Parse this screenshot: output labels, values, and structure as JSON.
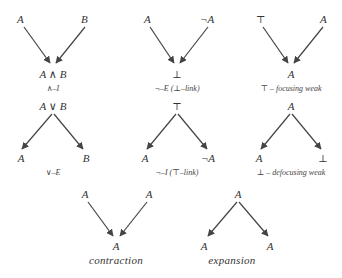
{
  "diagrams": [
    {
      "id": "and-intro",
      "top_left": "A",
      "top_right": "B",
      "bottom": "A ∧ B",
      "label": "∧–I",
      "direction": "converge"
    },
    {
      "id": "not-elim",
      "top_left": "A",
      "top_right": "¬A",
      "bottom": "⊥",
      "label": "¬–E  (⊥–link)",
      "direction": "converge"
    },
    {
      "id": "top-focusing-weak",
      "top_left": "⊤",
      "top_right": "A",
      "bottom": "A",
      "label": "⊤ – focusing weak",
      "direction": "converge"
    },
    {
      "id": "or-elim",
      "top": "A ∨ B",
      "bottom_left": "A",
      "bottom_right": "B",
      "label": "∨–E",
      "direction": "diverge"
    },
    {
      "id": "not-intro",
      "top": "⊤",
      "bottom_left": "A",
      "bottom_right": "¬A",
      "label": "¬–I  (⊤–link)",
      "direction": "diverge"
    },
    {
      "id": "bot-defocusing-weak",
      "top": "A",
      "bottom_left": "A",
      "bottom_right": "⊥",
      "label": "⊥ – defocusing weak",
      "direction": "diverge"
    },
    {
      "id": "contraction",
      "top_left": "A",
      "top_right": "A",
      "bottom": "A",
      "label": "contraction",
      "direction": "converge"
    },
    {
      "id": "expansion",
      "top": "A",
      "bottom_left": "A",
      "bottom_right": "A",
      "label": "expansion",
      "direction": "diverge"
    }
  ],
  "colors": {
    "ink": "#333333",
    "edge": "#444444",
    "background": "#ffffff"
  }
}
